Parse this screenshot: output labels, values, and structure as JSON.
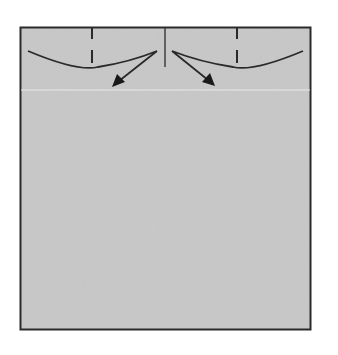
{
  "diagram": {
    "type": "origami-fold-step",
    "colors": {
      "background": "#ffffff",
      "paper": "#c9c9c9",
      "outline": "#2a2a2a",
      "guide_line": "#e6e6e6"
    },
    "paper": {
      "x": 20,
      "y": 27,
      "width": 291,
      "height": 303
    },
    "center_crease": {
      "x": 165,
      "y1": 27,
      "y2": 67
    },
    "valley_folds": [
      {
        "side": "left",
        "x": 92
      },
      {
        "side": "right",
        "x": 237
      }
    ],
    "fold_arrows": [
      {
        "side": "left",
        "direction": "down-left"
      },
      {
        "side": "right",
        "direction": "down-right"
      }
    ],
    "guide_line_y": 90
  }
}
